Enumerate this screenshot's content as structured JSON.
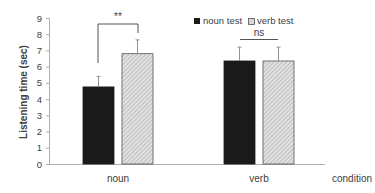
{
  "chart_data": {
    "type": "bar",
    "title": "",
    "xlabel": "condition",
    "ylabel": "Listening time (sec)",
    "ylim": [
      0,
      9
    ],
    "yticks": [
      0,
      1,
      2,
      3,
      4,
      5,
      6,
      7,
      8,
      9
    ],
    "grid": false,
    "legend_position": "top-right",
    "categories": [
      "noun",
      "verb"
    ],
    "series": [
      {
        "name": "noun test",
        "values": [
          4.75,
          6.35
        ],
        "errors": [
          0.65,
          0.85
        ],
        "color": "#1a1a1a",
        "pattern": "solid"
      },
      {
        "name": "verb test",
        "values": [
          6.8,
          6.35
        ],
        "errors": [
          0.85,
          0.85
        ],
        "color": "#d0d0d0",
        "pattern": "hatched"
      }
    ],
    "annotations": [
      {
        "category": "noun",
        "text": "**",
        "type": "significance-bracket"
      },
      {
        "category": "verb",
        "text": "ns",
        "type": "significance-line"
      }
    ]
  },
  "labels": {
    "ylabel": "Listening time (sec)",
    "xlabel": "condition",
    "cat0": "noun",
    "cat1": "verb",
    "legend0": "noun test",
    "legend1": "verb test",
    "sig0": "**",
    "sig1": "ns"
  }
}
